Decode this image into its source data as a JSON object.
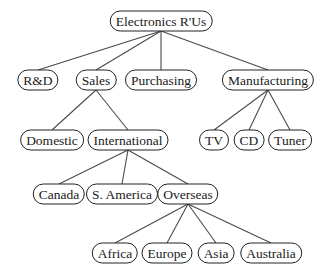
{
  "diagram": {
    "type": "tree",
    "title": "Electronics R'Us",
    "colors": {
      "line": "#4a4a4a",
      "border": "#222222",
      "text": "#1a1a1a",
      "background": "#ffffff"
    },
    "nodes": [
      {
        "id": "root",
        "label": "Electronics R'Us",
        "x": 161,
        "y": 21
      },
      {
        "id": "rnd",
        "label": "R&D",
        "x": 38,
        "y": 80,
        "parent": "root"
      },
      {
        "id": "sales",
        "label": "Sales",
        "x": 96,
        "y": 80,
        "parent": "root"
      },
      {
        "id": "purchasing",
        "label": "Purchasing",
        "x": 161,
        "y": 80,
        "parent": "root"
      },
      {
        "id": "manufacturing",
        "label": "Manufacturing",
        "x": 268,
        "y": 80,
        "parent": "root"
      },
      {
        "id": "domestic",
        "label": "Domestic",
        "x": 52,
        "y": 140,
        "parent": "sales"
      },
      {
        "id": "international",
        "label": "International",
        "x": 128,
        "y": 140,
        "parent": "sales"
      },
      {
        "id": "tv",
        "label": "TV",
        "x": 214,
        "y": 140,
        "parent": "manufacturing"
      },
      {
        "id": "cd",
        "label": "CD",
        "x": 249,
        "y": 140,
        "parent": "manufacturing"
      },
      {
        "id": "tuner",
        "label": "Tuner",
        "x": 290,
        "y": 140,
        "parent": "manufacturing"
      },
      {
        "id": "canada",
        "label": "Canada",
        "x": 59,
        "y": 194,
        "parent": "international"
      },
      {
        "id": "samerica",
        "label": "S. America",
        "x": 122,
        "y": 194,
        "parent": "international"
      },
      {
        "id": "overseas",
        "label": "Overseas",
        "x": 188,
        "y": 194,
        "parent": "international"
      },
      {
        "id": "africa",
        "label": "Africa",
        "x": 115,
        "y": 253,
        "parent": "overseas"
      },
      {
        "id": "europe",
        "label": "Europe",
        "x": 167,
        "y": 253,
        "parent": "overseas"
      },
      {
        "id": "asia",
        "label": "Asia",
        "x": 216,
        "y": 253,
        "parent": "overseas"
      },
      {
        "id": "australia",
        "label": "Australia",
        "x": 271,
        "y": 253,
        "parent": "overseas"
      }
    ]
  }
}
